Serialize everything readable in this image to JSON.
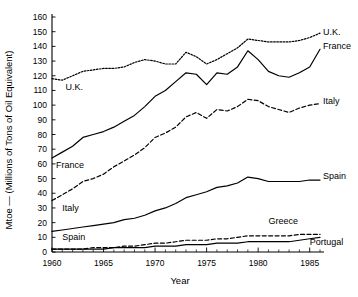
{
  "chart_data": {
    "type": "line",
    "title": "",
    "xlabel": "Year",
    "ylabel": "Mtoe — (Millions of Tons of Oil Equivalent)",
    "xlim": [
      1960,
      1986
    ],
    "ylim": [
      0,
      160
    ],
    "grid": false,
    "legend_position": "inline-right",
    "x_ticks": [
      1960,
      1965,
      1970,
      1975,
      1980,
      1985
    ],
    "x_tick_labels": [
      "1960",
      "1965",
      "1970",
      "1975",
      "1980",
      "1985"
    ],
    "x_minor_tick_step": 1,
    "y_ticks": [
      0,
      10,
      20,
      30,
      40,
      50,
      60,
      70,
      80,
      90,
      100,
      110,
      120,
      130,
      140,
      150,
      160
    ],
    "y_tick_labels": [
      "0",
      "10",
      "20",
      "30",
      "40",
      "50",
      "60",
      "70",
      "80",
      "90",
      "100",
      "110",
      "120",
      "130",
      "140",
      "150",
      "160"
    ],
    "x": [
      1960,
      1961,
      1962,
      1963,
      1964,
      1965,
      1966,
      1967,
      1968,
      1969,
      1970,
      1971,
      1972,
      1973,
      1974,
      1975,
      1976,
      1977,
      1978,
      1979,
      1980,
      1981,
      1982,
      1983,
      1984,
      1985,
      1986
    ],
    "series": [
      {
        "name": "U.K.",
        "style": "dotted",
        "values": [
          118,
          117,
          120,
          123,
          124,
          125,
          125,
          126,
          129,
          131,
          130,
          128,
          128,
          136,
          133,
          128,
          131,
          135,
          139,
          145,
          144,
          143,
          143,
          143,
          144,
          146,
          149
        ]
      },
      {
        "name": "France",
        "style": "solid",
        "values": [
          64,
          68,
          72,
          78,
          80,
          82,
          85,
          89,
          93,
          99,
          106,
          110,
          116,
          122,
          121,
          114,
          122,
          121,
          126,
          137,
          131,
          123,
          120,
          119,
          122,
          126,
          138
        ]
      },
      {
        "name": "Italy",
        "style": "dashed",
        "values": [
          35,
          39,
          43,
          48,
          50,
          53,
          58,
          62,
          66,
          71,
          78,
          81,
          85,
          92,
          95,
          91,
          97,
          96,
          99,
          104,
          103,
          99,
          97,
          95,
          98,
          100,
          101
        ]
      },
      {
        "name": "Spain",
        "style": "solid",
        "values": [
          14,
          15,
          16,
          17,
          18,
          19,
          20,
          22,
          23,
          25,
          28,
          30,
          33,
          37,
          39,
          41,
          44,
          45,
          47,
          51,
          50,
          48,
          48,
          48,
          48,
          49,
          49
        ]
      },
      {
        "name": "Greece",
        "style": "dashed",
        "values": [
          2,
          2,
          2,
          2,
          3,
          3,
          3,
          4,
          4,
          5,
          6,
          6,
          7,
          8,
          8,
          8,
          9,
          9,
          10,
          11,
          11,
          11,
          11,
          11,
          12,
          12,
          12
        ]
      },
      {
        "name": "Portugal",
        "style": "solid",
        "values": [
          2,
          2,
          2,
          2,
          2,
          2,
          3,
          3,
          3,
          3,
          4,
          4,
          4,
          5,
          5,
          5,
          6,
          6,
          6,
          7,
          7,
          7,
          7,
          7,
          8,
          9,
          10
        ]
      }
    ],
    "inline_labels_left": [
      {
        "text": "U.K.",
        "x_value": 1961.3,
        "y_value": 110
      },
      {
        "text": "France",
        "x_value": 1960.4,
        "y_value": 57
      },
      {
        "text": "Italy",
        "x_value": 1961.0,
        "y_value": 28
      },
      {
        "text": "Spain",
        "x_value": 1961.0,
        "y_value": 8
      }
    ],
    "inline_labels_right": [
      {
        "text": "U.K.",
        "x_value": 1986.3,
        "y_value": 148
      },
      {
        "text": "France",
        "x_value": 1986.3,
        "y_value": 138
      },
      {
        "text": "Italy",
        "x_value": 1986.3,
        "y_value": 101
      },
      {
        "text": "Spain",
        "x_value": 1986.3,
        "y_value": 50
      },
      {
        "text": "Greece",
        "x_value": 1981.0,
        "y_value": 19
      },
      {
        "text": "Portugal",
        "x_value": 1985.0,
        "y_value": 5
      }
    ]
  }
}
